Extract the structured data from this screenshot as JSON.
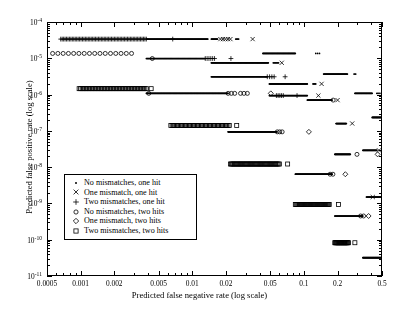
{
  "chart_data": {
    "type": "scatter",
    "title": "",
    "xlabel": "Predicted false negative rate (log scale)",
    "ylabel": "Predicted false positive rate (log scale)",
    "xscale": "log",
    "yscale": "log",
    "xlim": [
      0.0005,
      0.5
    ],
    "ylim": [
      1e-11,
      0.0001
    ],
    "grid": false,
    "legend_position": "center-left",
    "xticks": [
      "0.0005",
      "0.001",
      "0.002",
      "0.005",
      "0.01",
      "0.02",
      "0.05",
      "0.1",
      "0.2",
      "0.5"
    ],
    "xtick_values": [
      0.0005,
      0.001,
      0.002,
      0.005,
      0.01,
      0.02,
      0.05,
      0.1,
      0.2,
      0.5
    ],
    "yticks": [
      "10-4",
      "10-5",
      "10-6",
      "10-7",
      "10-8",
      "10-9",
      "10-10",
      "10-11"
    ],
    "ytick_values": [
      0.0001,
      1e-05,
      1e-06,
      1e-07,
      1e-08,
      1e-09,
      1e-10,
      1e-11
    ],
    "ytick_exponents": [
      -4,
      -5,
      -6,
      -7,
      -8,
      -9,
      -10,
      -11
    ],
    "series": [
      {
        "name": "No mismatches, one hit",
        "marker": "dot",
        "bands": [
          {
            "y": 3.6e-05,
            "x0": 0.0038,
            "x1": 0.0135,
            "n": 130
          },
          {
            "y": 3.6e-05,
            "x0": 0.0145,
            "x1": 0.0165,
            "n": 14
          },
          {
            "y": 3.6e-05,
            "x0": 0.024,
            "x1": 0.0255,
            "n": 5
          },
          {
            "y": 1.45e-05,
            "x0": 0.042,
            "x1": 0.082,
            "n": 60
          },
          {
            "y": 1.45e-05,
            "x0": 0.125,
            "x1": 0.135,
            "n": 3
          },
          {
            "y": 1.05e-05,
            "x0": 0.0038,
            "x1": 0.0128,
            "n": 120
          },
          {
            "y": 8e-06,
            "x0": 0.0145,
            "x1": 0.047,
            "n": 130
          },
          {
            "y": 8e-06,
            "x0": 0.052,
            "x1": 0.058,
            "n": 8
          },
          {
            "y": 3.9e-06,
            "x0": 0.147,
            "x1": 0.24,
            "n": 55
          },
          {
            "y": 3.9e-06,
            "x0": 0.275,
            "x1": 0.285,
            "n": 3
          },
          {
            "y": 3.3e-06,
            "x0": 0.0145,
            "x1": 0.046,
            "n": 120
          },
          {
            "y": 2.1e-06,
            "x0": 0.048,
            "x1": 0.105,
            "n": 90
          },
          {
            "y": 2.1e-06,
            "x0": 0.118,
            "x1": 0.125,
            "n": 5
          },
          {
            "y": 1.15e-06,
            "x0": 0.0038,
            "x1": 0.0205,
            "n": 180
          },
          {
            "y": 1.15e-06,
            "x0": 0.28,
            "x1": 0.4,
            "n": 40
          },
          {
            "y": 1.15e-06,
            "x0": 0.44,
            "x1": 0.47,
            "n": 4
          },
          {
            "y": 1e-06,
            "x0": 0.048,
            "x1": 0.105,
            "n": 80
          },
          {
            "y": 7.5e-07,
            "x0": 0.105,
            "x1": 0.175,
            "n": 70
          },
          {
            "y": 2.5e-07,
            "x0": 0.4,
            "x1": 0.5,
            "n": 30
          },
          {
            "y": 1e-07,
            "x0": 0.0205,
            "x1": 0.056,
            "n": 160
          },
          {
            "y": 1.7e-07,
            "x0": 0.19,
            "x1": 0.235,
            "n": 40
          },
          {
            "y": 3.1e-08,
            "x0": 0.33,
            "x1": 0.44,
            "n": 40
          },
          {
            "y": 2.4e-08,
            "x0": 0.185,
            "x1": 0.255,
            "n": 60
          },
          {
            "y": 6.8e-09,
            "x0": 0.082,
            "x1": 0.175,
            "n": 90
          },
          {
            "y": 1.6e-09,
            "x0": 0.355,
            "x1": 0.5,
            "n": 45
          },
          {
            "y": 4.8e-10,
            "x0": 0.185,
            "x1": 0.33,
            "n": 70
          },
          {
            "y": 3.4e-11,
            "x0": 0.33,
            "x1": 0.5,
            "n": 60
          }
        ]
      },
      {
        "name": "One mismatch, one hit",
        "marker": "cross",
        "bands": [
          {
            "y": 3.6e-05,
            "x0": 0.0175,
            "x1": 0.0215,
            "n": 5
          },
          {
            "y": 3.6e-05,
            "x0": 0.0335,
            "x1": 0.0345,
            "n": 1
          },
          {
            "y": 8e-06,
            "x0": 0.0615,
            "x1": 0.0625,
            "n": 1
          },
          {
            "y": 2.1e-06,
            "x0": 0.137,
            "x1": 0.145,
            "n": 1
          },
          {
            "y": 1e-06,
            "x0": 0.128,
            "x1": 0.136,
            "n": 1
          },
          {
            "y": 7.5e-07,
            "x0": 0.192,
            "x1": 0.2,
            "n": 1
          },
          {
            "y": 1.7e-07,
            "x0": 0.26,
            "x1": 0.27,
            "n": 1
          },
          {
            "y": 3.1e-08,
            "x0": 0.455,
            "x1": 0.465,
            "n": 1
          },
          {
            "y": 1.6e-09,
            "x0": 0.4,
            "x1": 0.41,
            "n": 1
          }
        ]
      },
      {
        "name": "Two mismatches, one hit",
        "marker": "plus",
        "bands": [
          {
            "y": 3.6e-05,
            "x0": 0.00065,
            "x1": 0.0038,
            "n": 60
          },
          {
            "y": 3.6e-05,
            "x0": 0.0063,
            "x1": 0.0068,
            "n": 1
          },
          {
            "y": 1.05e-05,
            "x0": 0.0128,
            "x1": 0.0155,
            "n": 6
          },
          {
            "y": 1.05e-05,
            "x0": 0.021,
            "x1": 0.0225,
            "n": 1
          },
          {
            "y": 3.3e-06,
            "x0": 0.046,
            "x1": 0.053,
            "n": 4
          },
          {
            "y": 3.3e-06,
            "x0": 0.064,
            "x1": 0.069,
            "n": 1
          },
          {
            "y": 1e-06,
            "x0": 0.0555,
            "x1": 0.064,
            "n": 5
          },
          {
            "y": 1e-06,
            "x0": 0.082,
            "x1": 0.088,
            "n": 1
          }
        ]
      },
      {
        "name": "No mismatches, two hits",
        "marker": "circle",
        "bands": [
          {
            "y": 1.45e-05,
            "x0": 0.00055,
            "x1": 0.0028,
            "n": 16
          },
          {
            "y": 1.05e-05,
            "x0": 0.0041,
            "x1": 0.0045,
            "n": 1
          },
          {
            "y": 1.15e-06,
            "x0": 0.0038,
            "x1": 0.0042,
            "n": 1
          },
          {
            "y": 1.15e-06,
            "x0": 0.0205,
            "x1": 0.0235,
            "n": 3
          },
          {
            "y": 1.15e-06,
            "x0": 0.0265,
            "x1": 0.0305,
            "n": 3
          },
          {
            "y": 1e-07,
            "x0": 0.0565,
            "x1": 0.0625,
            "n": 3
          },
          {
            "y": 7.5e-07,
            "x0": 0.175,
            "x1": 0.183,
            "n": 1
          },
          {
            "y": 2.4e-08,
            "x0": 0.285,
            "x1": 0.3,
            "n": 1
          },
          {
            "y": 6.8e-09,
            "x0": 0.168,
            "x1": 0.178,
            "n": 2
          },
          {
            "y": 4.8e-10,
            "x0": 0.315,
            "x1": 0.335,
            "n": 2
          }
        ]
      },
      {
        "name": "One mismatch, two hits",
        "marker": "diamond",
        "bands": [
          {
            "y": 1.15e-06,
            "x0": 0.047,
            "x1": 0.052,
            "n": 1
          },
          {
            "y": 1e-07,
            "x0": 0.105,
            "x1": 0.112,
            "n": 1
          },
          {
            "y": 6.8e-09,
            "x0": 0.225,
            "x1": 0.235,
            "n": 1
          },
          {
            "y": 4.8e-10,
            "x0": 0.365,
            "x1": 0.378,
            "n": 1
          },
          {
            "y": 2.4e-08,
            "x0": 0.44,
            "x1": 0.455,
            "n": 1
          }
        ]
      },
      {
        "name": "Two mismatches, two hits",
        "marker": "square",
        "bands": [
          {
            "y": 1.55e-06,
            "x0": 0.00095,
            "x1": 0.0038,
            "n": 46
          },
          {
            "y": 1.55e-06,
            "x0": 0.004,
            "x1": 0.0044,
            "n": 1
          },
          {
            "y": 1.5e-07,
            "x0": 0.0063,
            "x1": 0.021,
            "n": 45
          },
          {
            "y": 1.5e-07,
            "x0": 0.0235,
            "x1": 0.0255,
            "n": 1
          },
          {
            "y": 1.3e-08,
            "x0": 0.0215,
            "x1": 0.059,
            "n": 45
          },
          {
            "y": 1.3e-08,
            "x0": 0.068,
            "x1": 0.072,
            "n": 1
          },
          {
            "y": 1e-09,
            "x0": 0.082,
            "x1": 0.165,
            "n": 40
          },
          {
            "y": 1e-09,
            "x0": 0.195,
            "x1": 0.205,
            "n": 1
          },
          {
            "y": 8.8e-11,
            "x0": 0.185,
            "x1": 0.245,
            "n": 25
          },
          {
            "y": 8.8e-11,
            "x0": 0.275,
            "x1": 0.285,
            "n": 1
          }
        ]
      }
    ]
  },
  "legend": {
    "items": [
      {
        "marker": "dot",
        "label": "No mismatches, one hit"
      },
      {
        "marker": "cross",
        "label": "One mismatch, one hit"
      },
      {
        "marker": "plus",
        "label": "Two mismatches, one hit"
      },
      {
        "marker": "circle",
        "label": "No mismatches, two hits"
      },
      {
        "marker": "diamond",
        "label": "One mismatch, two hits"
      },
      {
        "marker": "square",
        "label": "Two mismatches, two hits"
      }
    ]
  },
  "colors": {
    "axis": "#000000",
    "marker": "#000000",
    "background": "#ffffff"
  }
}
